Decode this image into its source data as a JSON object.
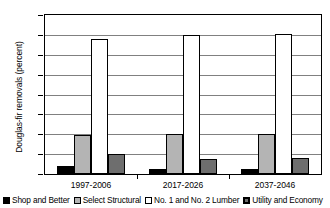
{
  "chart_data": {
    "type": "bar",
    "title": "",
    "xlabel": "",
    "ylabel": "Douglas-fir removals (percent)",
    "categories": [
      "1997-2006",
      "2017-2026",
      "2037-2046"
    ],
    "ylim": [
      0,
      80
    ],
    "yticks": [
      0,
      10,
      20,
      30,
      40,
      50,
      60,
      70,
      80
    ],
    "grid": true,
    "legend_position": "bottom",
    "series": [
      {
        "name": "Shop and Better",
        "color": "#000000",
        "values": [
          4.0,
          2.5,
          2.5
        ]
      },
      {
        "name": "Select Structural",
        "color": "#b4b4b4",
        "values": [
          19.5,
          20.0,
          20.0
        ]
      },
      {
        "name": "No. 1 and No. 2 Lumber",
        "color": "#ffffff",
        "values": [
          68.0,
          70.0,
          70.5
        ]
      },
      {
        "name": "Utility and Economy",
        "color": "#6e6e6e",
        "values": [
          10.0,
          7.5,
          8.0
        ]
      }
    ]
  }
}
